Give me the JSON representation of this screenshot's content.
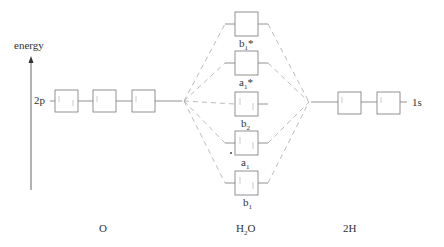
{
  "axis": {
    "label": "energy"
  },
  "left": {
    "atom_label": "O",
    "orbital_label": "2p",
    "orbitals": [
      {
        "electrons": 2
      },
      {
        "electrons": 1
      },
      {
        "electrons": 1
      }
    ]
  },
  "right": {
    "atom_label": "2H",
    "orbital_label": "1s",
    "orbitals": [
      {
        "electrons": 1
      },
      {
        "electrons": 1
      }
    ]
  },
  "center": {
    "molecule_label_main": "H",
    "molecule_label_sub": "2",
    "molecule_label_tail": "O",
    "orbitals": [
      {
        "name": "b",
        "sub": "1",
        "sup": "*",
        "electrons": 0
      },
      {
        "name": "a",
        "sub": "1",
        "sup": "*",
        "electrons": 0
      },
      {
        "name": "b",
        "sub": "2",
        "sup": "",
        "electrons": 2
      },
      {
        "name": "a",
        "sub": "1",
        "sup": "",
        "electrons": 2
      },
      {
        "name": "b",
        "sub": "1",
        "sup": "",
        "electrons": 2
      }
    ]
  },
  "colors": {
    "line": "#888888",
    "dash": "#aaaaaa",
    "box": "#777777",
    "text": "#333333"
  }
}
